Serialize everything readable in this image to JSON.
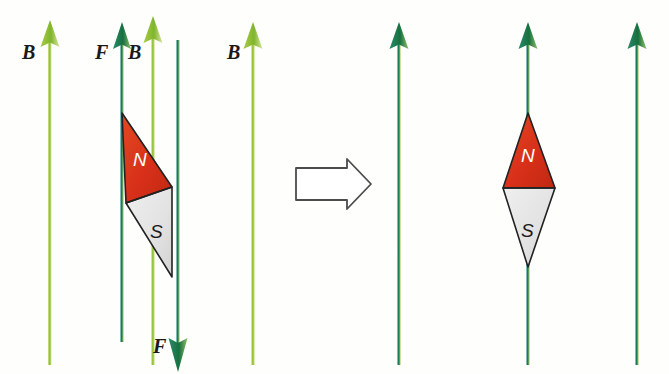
{
  "figure": {
    "background_color": "#fefefd",
    "colors": {
      "field_line_light": "#9ac43c",
      "field_line_dark": "#1d7a4c",
      "force_arrow": "#1d7a4c",
      "magnet_north": "#d9331a",
      "magnet_south": "#e0e0e0",
      "outline": "#222222",
      "label_text": "#1a1a1a",
      "block_arrow_stroke": "#555555",
      "block_arrow_fill": "#ffffff"
    }
  },
  "left_panel": {
    "labels": {
      "b_left": "B",
      "f_top": "F",
      "b_middle": "B",
      "f_bottom": "F",
      "b_right": "B"
    },
    "magnet": {
      "north_label": "N",
      "south_label": "S",
      "orientation": "tilted"
    },
    "field_lines": [
      {
        "name": "field-line-1",
        "x": 50,
        "color": "light",
        "direction": "up"
      },
      {
        "name": "field-line-2",
        "x": 122,
        "color": "dark",
        "direction": "up"
      },
      {
        "name": "field-line-3",
        "x": 153,
        "color": "light",
        "direction": "up"
      },
      {
        "name": "field-line-4",
        "x": 253,
        "color": "light",
        "direction": "up"
      }
    ],
    "force_arrows": [
      {
        "name": "force-arrow-up",
        "direction": "up",
        "label": "F"
      },
      {
        "name": "force-arrow-down",
        "direction": "down",
        "label": "F"
      }
    ]
  },
  "transition": {
    "icon": "block-arrow-right",
    "direction": "right"
  },
  "right_panel": {
    "magnet": {
      "north_label": "N",
      "south_label": "S",
      "orientation": "aligned"
    },
    "field_lines": [
      {
        "name": "field-line-5",
        "x": 399,
        "color": "dark",
        "direction": "up"
      },
      {
        "name": "field-line-6",
        "x": 528,
        "color": "dark",
        "direction": "up"
      },
      {
        "name": "field-line-7",
        "x": 637,
        "color": "dark",
        "direction": "up"
      }
    ]
  }
}
